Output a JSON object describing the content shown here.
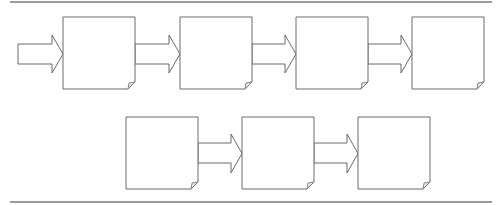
{
  "diagram": {
    "type": "process-flow",
    "colors": {
      "stroke": "#6b6b6b",
      "rule": "#7a7a7a",
      "fill": "#ffffff"
    },
    "rules": {
      "top": {
        "x1": 10,
        "x2": 492,
        "y": 2
      },
      "bottom": {
        "x1": 10,
        "x2": 492,
        "y": 202
      }
    },
    "input_arrow": {
      "x": 18,
      "y": 35,
      "shaft_end": 52,
      "tip": 63,
      "shaft_top": 44,
      "shaft_bottom": 64,
      "head_top": 35,
      "head_bottom": 73
    },
    "rows": [
      {
        "id": "row-1",
        "box_top": 17,
        "box_height": 72,
        "arrow_shaft_top": 44,
        "arrow_shaft_bottom": 64,
        "arrow_head_top": 35,
        "arrow_head_bottom": 73,
        "boxes": [
          {
            "id": "step-1",
            "x": 63,
            "label": ""
          },
          {
            "id": "step-2",
            "x": 180,
            "label": ""
          },
          {
            "id": "step-3",
            "x": 296,
            "label": ""
          },
          {
            "id": "step-4",
            "x": 412,
            "label": ""
          }
        ]
      },
      {
        "id": "row-2",
        "box_top": 117,
        "box_height": 72,
        "arrow_shaft_top": 143,
        "arrow_shaft_bottom": 163,
        "arrow_head_top": 134,
        "arrow_head_bottom": 173,
        "boxes": [
          {
            "id": "step-5",
            "x": 126,
            "label": ""
          },
          {
            "id": "step-6",
            "x": 242,
            "label": ""
          },
          {
            "id": "step-7",
            "x": 358,
            "label": ""
          }
        ]
      }
    ],
    "box_width": 72,
    "fold_size": 7,
    "arrow_head_length": 11
  }
}
